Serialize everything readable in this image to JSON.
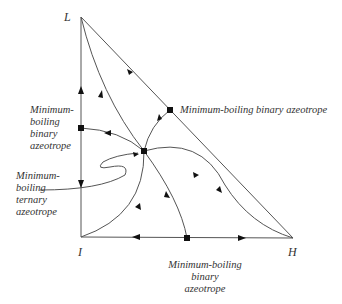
{
  "diagram": {
    "type": "ternary residue curve map",
    "vertices": {
      "L": {
        "label": "L",
        "x": 81,
        "y": 17
      },
      "I": {
        "label": "I",
        "x": 81,
        "y": 237
      },
      "H": {
        "label": "H",
        "x": 293,
        "y": 238
      }
    },
    "azeotropes": {
      "binary_LI": {
        "x": 81,
        "y": 128,
        "label_lines": [
          "Minimum-",
          "boiling",
          "binary",
          "azeotrope"
        ]
      },
      "binary_LH": {
        "x": 170,
        "y": 110,
        "label": "Minimum-boiling binary azeotrope"
      },
      "binary_IH": {
        "x": 187,
        "y": 238,
        "label_lines": [
          "Minimum-boiling",
          "binary",
          "azeotrope"
        ]
      },
      "ternary": {
        "x": 144,
        "y": 151,
        "label_lines": [
          "Minimum-",
          "boiling",
          "ternary",
          "azeotrope"
        ]
      }
    },
    "colors": {
      "line": "#555555",
      "marker": "#111111",
      "text": "#333333"
    }
  }
}
